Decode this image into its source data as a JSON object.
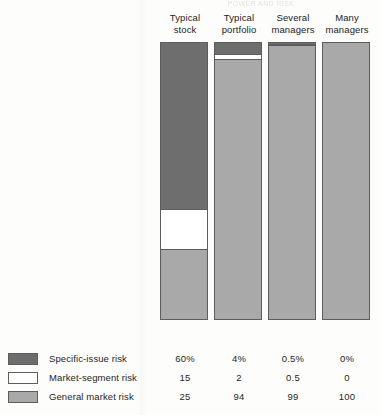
{
  "figure": {
    "cropped_top_text": "POWER AND RISK",
    "columns": [
      {
        "line1": "Typical",
        "line2": "stock"
      },
      {
        "line1": "Typical",
        "line2": "portfolio"
      },
      {
        "line1": "Several",
        "line2": "managers"
      },
      {
        "line1": "Many",
        "line2": "managers"
      }
    ],
    "legend": [
      {
        "label": "Specific-issue risk",
        "color": "#6e6e6e",
        "key": "specific"
      },
      {
        "label": "Market-segment risk",
        "color": "#ffffff",
        "key": "segment"
      },
      {
        "label": "General market risk",
        "color": "#a9a9a9",
        "key": "general"
      }
    ],
    "value_rows": [
      [
        "60%",
        "4%",
        "0.5%",
        "0%"
      ],
      [
        "15",
        "2",
        "0.5",
        "0"
      ],
      [
        "25",
        "94",
        "99",
        "100"
      ]
    ]
  },
  "chart_data": {
    "type": "bar",
    "subtype": "stacked-bar-100pct",
    "title": "",
    "xlabel": "",
    "ylabel": "",
    "ylim": [
      0,
      100
    ],
    "grid": false,
    "legend_position": "bottom-left",
    "categories": [
      "Typical stock",
      "Typical portfolio",
      "Several managers",
      "Many managers"
    ],
    "series": [
      {
        "name": "Specific-issue risk",
        "color": "#6e6e6e",
        "values": [
          60,
          4,
          0.5,
          0
        ],
        "labels": [
          "60%",
          "4%",
          "0.5%",
          "0%"
        ]
      },
      {
        "name": "Market-segment risk",
        "color": "#ffffff",
        "values": [
          15,
          2,
          0.5,
          0
        ],
        "labels": [
          "15",
          "2",
          "0.5",
          "0"
        ]
      },
      {
        "name": "General market risk",
        "color": "#a9a9a9",
        "values": [
          25,
          94,
          99,
          100
        ],
        "labels": [
          "25",
          "94",
          "99",
          "100"
        ]
      }
    ],
    "annotations": [
      "Values are percentages of total portfolio risk and sum to 100 in each column."
    ]
  }
}
